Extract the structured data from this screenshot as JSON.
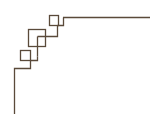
{
  "ornament": {
    "description": "Greek key style corner border ornament",
    "stroke_color": "#5a4a3a",
    "background": "#ffffff"
  }
}
